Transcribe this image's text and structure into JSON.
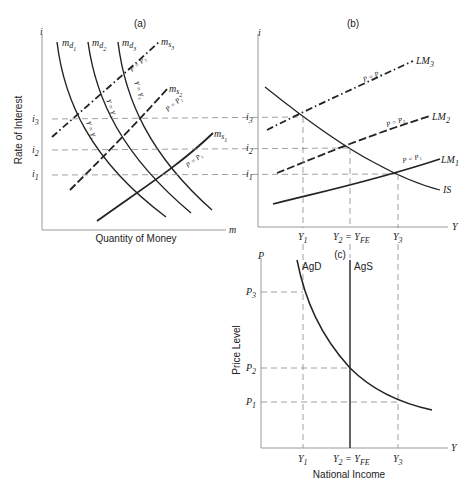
{
  "figure": {
    "panel_a": {
      "title": "(a)",
      "y_axis_symbol": "i",
      "y_axis_label": "Rate of Interest",
      "x_axis_symbol": "m",
      "x_axis_label": "Quantity of Money",
      "y_ticks": [
        {
          "base": "i",
          "sub": "3"
        },
        {
          "base": "i",
          "sub": "2"
        },
        {
          "base": "i",
          "sub": "1"
        }
      ],
      "demand_curves": [
        {
          "base": "m",
          "sub": "d",
          "subsub": "1",
          "annotation": "Y = Y₁"
        },
        {
          "base": "m",
          "sub": "d",
          "subsub": "2",
          "annotation": "Y = Y₂"
        },
        {
          "base": "m",
          "sub": "d",
          "subsub": "3",
          "annotation": "Y = Y₃"
        }
      ],
      "supply_curves": [
        {
          "base": "m",
          "sub": "s",
          "subsub": "3",
          "annotation": "P = P₃",
          "style": "dash-dot"
        },
        {
          "base": "m",
          "sub": "s",
          "subsub": "2",
          "annotation": "P = P₂",
          "style": "dashed"
        },
        {
          "base": "m",
          "sub": "s",
          "subsub": "1",
          "annotation": "P = P₁",
          "style": "solid"
        }
      ]
    },
    "panel_b": {
      "title": "(b)",
      "y_axis_symbol": "i",
      "x_axis_symbol": "Y",
      "y_ticks": [
        {
          "base": "i",
          "sub": "3"
        },
        {
          "base": "i",
          "sub": "2"
        },
        {
          "base": "i",
          "sub": "1"
        }
      ],
      "x_ticks": [
        {
          "base": "Y",
          "sub": "1",
          "suffix": ""
        },
        {
          "base": "Y",
          "sub": "2",
          "suffix": " = Y",
          "suffix_sub": "FE"
        },
        {
          "base": "Y",
          "sub": "3",
          "suffix": ""
        }
      ],
      "curves": [
        {
          "base": "LM",
          "sub": "3",
          "annotation": "P = P₃",
          "style": "dash-dot"
        },
        {
          "base": "LM",
          "sub": "2",
          "annotation": "P = P₂",
          "style": "dashed"
        },
        {
          "base": "LM",
          "sub": "1",
          "annotation": "P = P₁",
          "style": "solid"
        },
        {
          "base": "IS",
          "sub": "",
          "annotation": "",
          "style": "solid"
        }
      ]
    },
    "panel_c": {
      "title": "(c)",
      "y_axis_symbol": "P",
      "y_axis_label": "Price Level",
      "x_axis_symbol": "Y",
      "x_axis_label": "National Income",
      "y_ticks": [
        {
          "base": "P",
          "sub": "3"
        },
        {
          "base": "P",
          "sub": "2"
        },
        {
          "base": "P",
          "sub": "1"
        }
      ],
      "x_ticks": [
        {
          "base": "Y",
          "sub": "1",
          "suffix": ""
        },
        {
          "base": "Y",
          "sub": "2",
          "suffix": " = Y",
          "suffix_sub": "FE"
        },
        {
          "base": "Y",
          "sub": "3",
          "suffix": ""
        }
      ],
      "curves": [
        {
          "label": "AgD",
          "style": "solid"
        },
        {
          "label": "AgS",
          "style": "solid-vertical"
        }
      ]
    }
  }
}
